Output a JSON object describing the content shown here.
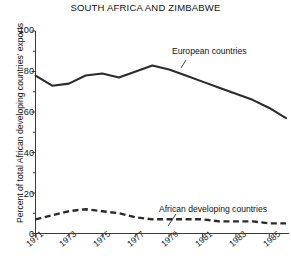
{
  "chart_data": {
    "type": "line",
    "title": "SOUTH AFRICA AND ZIMBABWE",
    "xlabel": "",
    "ylabel": "Percent of total African developing countries' exports",
    "ylim": [
      0,
      100
    ],
    "xlim": [
      1971,
      1986
    ],
    "yticks": [
      0,
      20,
      40,
      60,
      80,
      100
    ],
    "ytick_labels": [
      "0",
      "20",
      "40",
      "60",
      "80",
      "100"
    ],
    "xticks": [
      1971,
      1973,
      1975,
      1977,
      1979,
      1981,
      1983,
      1985
    ],
    "xtick_labels": [
      "1971",
      "1973",
      "1975",
      "1977",
      "1979",
      "1981",
      "1983",
      "1985"
    ],
    "grid": false,
    "legend_position": "inline-annotation",
    "x": [
      1971,
      1972,
      1973,
      1974,
      1975,
      1976,
      1977,
      1978,
      1979,
      1980,
      1981,
      1982,
      1983,
      1984,
      1985,
      1986
    ],
    "series": [
      {
        "name": "European countries",
        "style": "solid",
        "color": "#2b2b2b",
        "values": [
          78,
          73,
          74,
          78,
          79,
          77,
          80,
          83,
          81,
          78,
          75,
          72,
          69,
          66,
          62,
          57
        ]
      },
      {
        "name": "African developing countries",
        "style": "dashed",
        "color": "#2b2b2b",
        "values": [
          7,
          9,
          11,
          12,
          11,
          10,
          8,
          7,
          7,
          7,
          7,
          6,
          6,
          6,
          5,
          5
        ]
      }
    ],
    "annotations": [
      {
        "id": "european",
        "text": "European countries"
      },
      {
        "id": "african",
        "text": "African developing countries"
      }
    ]
  }
}
